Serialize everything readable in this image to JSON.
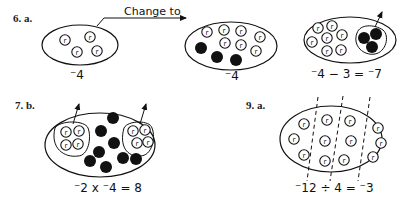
{
  "problems": {
    "p6": {
      "label": "6.  a.",
      "arrow_text": "Change to",
      "set1_value": "⁻4",
      "set2_value": "⁻4",
      "set3_equation": "⁻4 − 3 = ⁻7"
    },
    "p7": {
      "label": "7.  b.",
      "equation": "⁻2 x ⁻4 = 8"
    },
    "p9": {
      "label": "9.  a.",
      "equation": "⁻12 ÷ 4 = ⁻3"
    }
  },
  "chips": {
    "red_chip_letter": "r",
    "colors": {
      "ink": "#111111",
      "background": "#ffffff"
    }
  }
}
